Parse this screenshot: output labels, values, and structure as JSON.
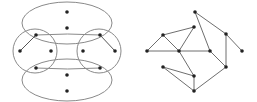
{
  "colors": {
    "background": "#ffffff",
    "stroke": "#8a8a8a",
    "node": "#222222"
  },
  "hypergraph": {
    "ellipses": [
      {
        "id": "top-ellipse",
        "cx": 67,
        "cy": 23,
        "rx": 45,
        "ry": 21
      },
      {
        "id": "bottom-ellipse",
        "cx": 67,
        "cy": 80,
        "rx": 45,
        "ry": 21
      }
    ],
    "circles": [
      {
        "id": "left-circle",
        "cx": 35,
        "cy": 51,
        "r": 22
      },
      {
        "id": "right-circle",
        "cx": 99,
        "cy": 51,
        "r": 22
      }
    ],
    "bands": [
      {
        "id": "upper-band",
        "d": "M36 35 Q67 33 100 35"
      },
      {
        "id": "lower-band",
        "d": "M36 68 Q67 70 100 68"
      }
    ],
    "nodes": [
      {
        "x": 67,
        "y": 12
      },
      {
        "x": 67,
        "y": 28
      },
      {
        "x": 36,
        "y": 35
      },
      {
        "x": 20,
        "y": 51
      },
      {
        "x": 51,
        "y": 51
      },
      {
        "x": 36,
        "y": 68
      },
      {
        "x": 100,
        "y": 35
      },
      {
        "x": 83,
        "y": 51
      },
      {
        "x": 115,
        "y": 51
      },
      {
        "x": 100,
        "y": 68
      },
      {
        "x": 67,
        "y": 75
      },
      {
        "x": 67,
        "y": 91
      }
    ],
    "edges": [
      [
        36,
        35,
        20,
        51
      ],
      [
        100,
        35,
        115,
        51
      ]
    ]
  },
  "graph": {
    "nodes": [
      {
        "id": "A",
        "x": 195,
        "y": 12
      },
      {
        "id": "B",
        "x": 194,
        "y": 27
      },
      {
        "id": "C",
        "x": 163,
        "y": 35
      },
      {
        "id": "D",
        "x": 147,
        "y": 51
      },
      {
        "id": "E",
        "x": 179,
        "y": 51
      },
      {
        "id": "F",
        "x": 210,
        "y": 51
      },
      {
        "id": "G",
        "x": 226,
        "y": 34
      },
      {
        "id": "H",
        "x": 242,
        "y": 51
      },
      {
        "id": "I",
        "x": 226,
        "y": 67
      },
      {
        "id": "J",
        "x": 163,
        "y": 67
      },
      {
        "id": "K",
        "x": 194,
        "y": 76
      },
      {
        "id": "L",
        "x": 194,
        "y": 91
      }
    ],
    "edges": [
      [
        "A",
        "F"
      ],
      [
        "A",
        "G"
      ],
      [
        "G",
        "H"
      ],
      [
        "G",
        "I"
      ],
      [
        "I",
        "L"
      ],
      [
        "F",
        "I"
      ],
      [
        "C",
        "B"
      ],
      [
        "B",
        "E"
      ],
      [
        "C",
        "D"
      ],
      [
        "C",
        "E"
      ],
      [
        "D",
        "E"
      ],
      [
        "E",
        "F"
      ],
      [
        "E",
        "K"
      ],
      [
        "J",
        "K"
      ],
      [
        "J",
        "L"
      ],
      [
        "K",
        "L"
      ]
    ]
  }
}
